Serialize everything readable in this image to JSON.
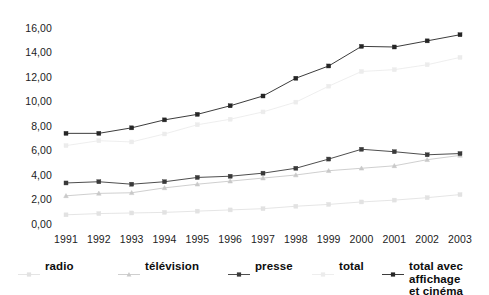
{
  "chart_data": {
    "type": "line",
    "title": "",
    "xlabel": "",
    "ylabel": "",
    "categories": [
      "1991",
      "1992",
      "1993",
      "1994",
      "1995",
      "1996",
      "1997",
      "1998",
      "1999",
      "2000",
      "2001",
      "2002",
      "2003"
    ],
    "ylim": [
      0.0,
      16.0
    ],
    "yticks": [
      "0,00",
      "2,00",
      "4,00",
      "6,00",
      "8,00",
      "10,00",
      "12,00",
      "14,00",
      "16,00"
    ],
    "ytick_values": [
      0,
      2,
      4,
      6,
      8,
      10,
      12,
      14,
      16
    ],
    "grid": false,
    "legend_position": "bottom",
    "decimal_separator": ",",
    "series": [
      {
        "name": "radio",
        "color": "#e2e2e2",
        "marker": "square",
        "values": [
          0.75,
          0.85,
          0.9,
          0.95,
          1.05,
          1.15,
          1.25,
          1.45,
          1.6,
          1.8,
          1.95,
          2.15,
          2.4
        ]
      },
      {
        "name": "télévision",
        "color": "#c9c9c9",
        "marker": "triangle",
        "values": [
          2.3,
          2.5,
          2.55,
          2.95,
          3.25,
          3.5,
          3.75,
          4.0,
          4.35,
          4.55,
          4.75,
          5.25,
          5.6
        ]
      },
      {
        "name": "presse",
        "color": "#3a3a3a",
        "marker": "square",
        "values": [
          3.35,
          3.45,
          3.25,
          3.45,
          3.8,
          3.9,
          4.15,
          4.55,
          5.3,
          6.1,
          5.9,
          5.65,
          5.75
        ]
      },
      {
        "name": "total",
        "color": "#ececec",
        "marker": "square",
        "values": [
          6.4,
          6.8,
          6.7,
          7.35,
          8.1,
          8.55,
          9.15,
          9.95,
          11.25,
          12.45,
          12.6,
          13.0,
          13.6
        ]
      },
      {
        "name": "total avec affichage\net cinéma",
        "color": "#262626",
        "marker": "square",
        "values": [
          7.4,
          7.4,
          7.85,
          8.5,
          8.95,
          9.65,
          10.45,
          11.9,
          12.9,
          14.5,
          14.45,
          14.95,
          15.45
        ]
      }
    ],
    "legend": [
      {
        "label": "radio",
        "color": "#e2e2e2",
        "marker": "square"
      },
      {
        "label": "télévision",
        "color": "#c9c9c9",
        "marker": "triangle"
      },
      {
        "label": "presse",
        "color": "#3a3a3a",
        "marker": "square"
      },
      {
        "label": "total",
        "color": "#ececec",
        "marker": "square"
      },
      {
        "label": "total avec affichage\net cinéma",
        "color": "#262626",
        "marker": "square"
      }
    ]
  }
}
